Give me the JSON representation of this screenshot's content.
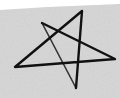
{
  "image": {
    "subject": "hand-drawn five-pointed star",
    "background_color": "#d9d9d9",
    "top_strip_color": "#ffffff",
    "stroke_color": "#111111",
    "vertices": [
      [
        42,
        23
      ],
      [
        76,
        88
      ],
      [
        82,
        11
      ],
      [
        15,
        67
      ],
      [
        115,
        59
      ]
    ]
  }
}
